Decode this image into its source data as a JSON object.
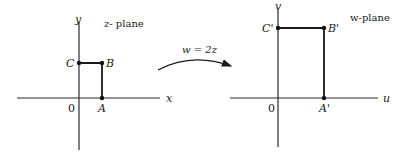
{
  "diagram": {
    "mapping": {
      "label": "w = 2z",
      "arrow": "curved-arrow-right"
    },
    "z_plane": {
      "title_var": "z",
      "title_rest": "- plane",
      "x_axis_label": "x",
      "y_axis_label": "y",
      "origin_label": "0",
      "points": [
        {
          "name": "A",
          "label": "A",
          "position": "on x-axis"
        },
        {
          "name": "B",
          "label": "B",
          "position": "corner"
        },
        {
          "name": "C",
          "label": "C",
          "position": "on y-axis"
        }
      ]
    },
    "w_plane": {
      "title_var": "w",
      "title_rest": "-plane",
      "u_axis_label": "u",
      "v_axis_label": "v",
      "origin_label": "0",
      "points": [
        {
          "name": "A'",
          "label": "A'",
          "position": "on u-axis"
        },
        {
          "name": "B'",
          "label": "B'",
          "position": "corner"
        },
        {
          "name": "C'",
          "label": "C'",
          "position": "on v-axis"
        }
      ]
    }
  },
  "colors": {
    "ink": "#1a1a1a",
    "background": "#ffffff"
  }
}
